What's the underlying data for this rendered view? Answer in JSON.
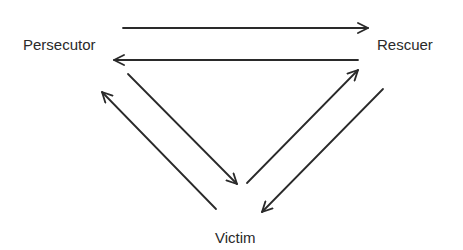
{
  "diagram": {
    "nodes": [
      {
        "id": "persecutor",
        "label": "Persecutor",
        "x": 23,
        "y": 50
      },
      {
        "id": "rescuer",
        "label": "Rescuer",
        "x": 377,
        "y": 50
      },
      {
        "id": "victim",
        "label": "Victim",
        "x": 215,
        "y": 243
      }
    ],
    "edges": [
      {
        "from": "persecutor",
        "to": "rescuer",
        "x1": 123,
        "y1": 28,
        "x2": 368,
        "y2": 28
      },
      {
        "from": "rescuer",
        "to": "persecutor",
        "x1": 358,
        "y1": 60,
        "x2": 114,
        "y2": 60
      },
      {
        "from": "persecutor",
        "to": "victim",
        "x1": 128,
        "y1": 74,
        "x2": 237,
        "y2": 184
      },
      {
        "from": "victim",
        "to": "persecutor",
        "x1": 216,
        "y1": 209,
        "x2": 102,
        "y2": 92
      },
      {
        "from": "victim",
        "to": "rescuer",
        "x1": 247,
        "y1": 183,
        "x2": 358,
        "y2": 70
      },
      {
        "from": "rescuer",
        "to": "victim",
        "x1": 383,
        "y1": 89,
        "x2": 262,
        "y2": 212
      }
    ],
    "colors": {
      "line": "#2a2a2a",
      "text": "#2a2a2a",
      "background": "#ffffff"
    }
  }
}
